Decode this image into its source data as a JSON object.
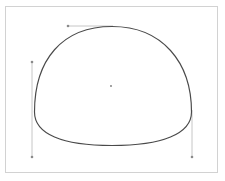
{
  "canvas": {
    "width": 225,
    "height": 181,
    "background_color": "#ffffff",
    "frame": {
      "label": "canvas frame",
      "border_color": "#d2d2d2",
      "x": 5,
      "y": 6,
      "width": 213,
      "height": 167
    }
  },
  "shape": {
    "name": "dome-path",
    "label": "Dome",
    "stroke_color": "#4a4a4a",
    "fill_color": "none",
    "stroke_width": 1.15,
    "path": "M 34.5 112 C 34.5 60 62 26.5 112 26.5 C 162 26.5 191.5 62 191.5 112 C 191.5 134 162 145.5 112 145.5 C 62 145.5 34.5 134 34.5 112 Z",
    "bounds": {
      "left": 34,
      "top": 26,
      "right": 192,
      "bottom": 146
    }
  },
  "handles": {
    "stroke_color": "#c0c0c0",
    "dot_color": "#8a8a8a",
    "items": [
      {
        "name": "top-handle",
        "label": "top width handle",
        "orientation": "horizontal",
        "x1": 68,
        "y1": 26,
        "x2": 113,
        "y2": 26,
        "dot_at": "start"
      },
      {
        "name": "left-handle",
        "label": "left height handle",
        "orientation": "vertical",
        "x1": 32,
        "y1": 62,
        "x2": 32,
        "y2": 157,
        "dot_at": "both"
      },
      {
        "name": "right-handle",
        "label": "right height handle",
        "orientation": "vertical",
        "x1": 192,
        "y1": 110,
        "x2": 192,
        "y2": 157,
        "dot_at": "end"
      }
    ]
  },
  "anchor": {
    "name": "center-anchor",
    "label": "center point",
    "x": 111,
    "y": 86,
    "color": "#7a7a7a",
    "radius": 0.9
  }
}
